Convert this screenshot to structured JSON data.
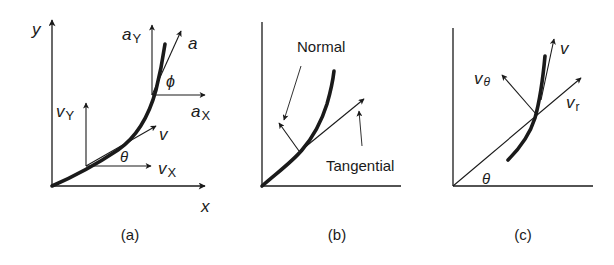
{
  "figure": {
    "background": "#ffffff",
    "ink": "#1a1a1a",
    "panels": [
      {
        "id": "a",
        "caption": "(a)",
        "axis_labels": {
          "x": "x",
          "y": "y"
        },
        "vectors": {
          "v": "v",
          "v_x": {
            "base": "v",
            "sub": "X"
          },
          "v_y": {
            "base": "v",
            "sub": "Y"
          },
          "a": "a",
          "a_x": {
            "base": "a",
            "sub": "X"
          },
          "a_y": {
            "base": "a",
            "sub": "Y"
          }
        },
        "angles": {
          "theta": "θ",
          "phi": "ϕ"
        }
      },
      {
        "id": "b",
        "caption": "(b)",
        "labels": {
          "normal": "Normal",
          "tangential": "Tangential"
        }
      },
      {
        "id": "c",
        "caption": "(c)",
        "vectors": {
          "v": "v",
          "v_theta": {
            "base": "v",
            "sub": "θ"
          },
          "v_r": {
            "base": "v",
            "sub": "r"
          }
        },
        "angles": {
          "theta": "θ"
        }
      }
    ]
  }
}
